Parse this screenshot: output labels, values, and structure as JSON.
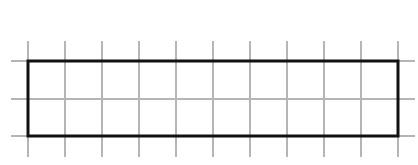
{
  "diagram": {
    "type": "grid-with-rectangle",
    "background_color": "#ffffff",
    "grid": {
      "color": "#b5b5b5",
      "stroke_width": 2,
      "vertical_lines_x": [
        28,
        65,
        102,
        139,
        176,
        213,
        250,
        287,
        324,
        361,
        398
      ],
      "vertical_extent_y": [
        41,
        157
      ],
      "horizontal_lines_y": [
        61,
        99,
        136
      ],
      "horizontal_extent_x": [
        11,
        415
      ],
      "columns": 10,
      "rows": 2
    },
    "rectangle": {
      "x": 28,
      "y": 61,
      "width": 370,
      "height": 75,
      "stroke_color": "#111111",
      "stroke_width": 3,
      "grid_units_wide": 10,
      "grid_units_high": 2
    }
  }
}
